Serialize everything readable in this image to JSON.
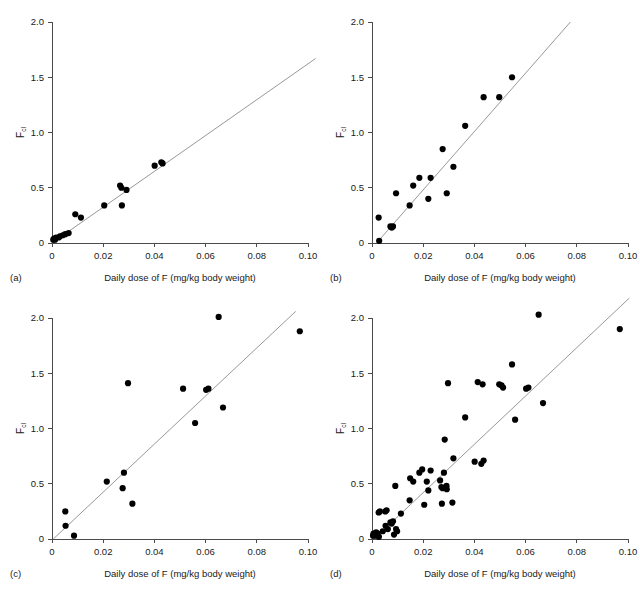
{
  "figure": {
    "width": 640,
    "height": 592,
    "background": "#ffffff",
    "point_color": "#000000",
    "line_color": "#8c8c8c",
    "axis_color": "#4a4a4a"
  },
  "chart_data": [
    {
      "type": "scatter",
      "panel": "(a)",
      "title": "",
      "xlabel": "Daily dose of F (mg/kg body weight)",
      "ylabel": "F",
      "ylabel_sub": "cl",
      "xlim": [
        0,
        0.105
      ],
      "ylim": [
        0,
        2.1
      ],
      "xticks": [
        0,
        0.02,
        0.04,
        0.06,
        0.08,
        0.1
      ],
      "xticklabels": [
        "0",
        "0.02",
        "0.04",
        "0.06",
        "0.08",
        "0.10"
      ],
      "yticks": [
        0,
        0.5,
        1.0,
        1.5,
        2.0
      ],
      "yticklabels": [
        "0",
        "0.5",
        "1.0",
        "1.5",
        "2.0"
      ],
      "grid": false,
      "legend": "none",
      "fit_line": {
        "x0": 0.0,
        "y0": 0.0,
        "x1": 0.103,
        "y1": 1.67
      },
      "points": [
        {
          "x": 0.0005,
          "y": 0.03
        },
        {
          "x": 0.0008,
          "y": 0.04
        },
        {
          "x": 0.0012,
          "y": 0.03
        },
        {
          "x": 0.0016,
          "y": 0.05
        },
        {
          "x": 0.0026,
          "y": 0.05
        },
        {
          "x": 0.0031,
          "y": 0.06
        },
        {
          "x": 0.0042,
          "y": 0.07
        },
        {
          "x": 0.0052,
          "y": 0.08
        },
        {
          "x": 0.0065,
          "y": 0.09
        },
        {
          "x": 0.0091,
          "y": 0.26
        },
        {
          "x": 0.0113,
          "y": 0.23
        },
        {
          "x": 0.0204,
          "y": 0.34
        },
        {
          "x": 0.0266,
          "y": 0.52
        },
        {
          "x": 0.0271,
          "y": 0.5
        },
        {
          "x": 0.0273,
          "y": 0.34
        },
        {
          "x": 0.0291,
          "y": 0.48
        },
        {
          "x": 0.0401,
          "y": 0.7
        },
        {
          "x": 0.0427,
          "y": 0.73
        },
        {
          "x": 0.0432,
          "y": 0.72
        }
      ]
    },
    {
      "type": "scatter",
      "panel": "(b)",
      "title": "",
      "xlabel": "Daily dose of F (mg/kg body weight)",
      "ylabel": "F",
      "ylabel_sub": "cl",
      "xlim": [
        0,
        0.105
      ],
      "ylim": [
        0,
        2.1
      ],
      "xticks": [
        0,
        0.02,
        0.04,
        0.06,
        0.08,
        0.1
      ],
      "xticklabels": [
        "0",
        "0.02",
        "0.04",
        "0.06",
        "0.08",
        "0.10"
      ],
      "yticks": [
        0,
        0.5,
        1.0,
        1.5,
        2.0
      ],
      "yticklabels": [
        "0",
        "0.5",
        "1.0",
        "1.5",
        "2.0"
      ],
      "grid": false,
      "legend": "none",
      "fit_line": {
        "x0": 0.0018,
        "y0": 0.0,
        "x1": 0.0775,
        "y1": 2.0
      },
      "points": [
        {
          "x": 0.0028,
          "y": 0.02
        },
        {
          "x": 0.0026,
          "y": 0.23
        },
        {
          "x": 0.0072,
          "y": 0.15
        },
        {
          "x": 0.0077,
          "y": 0.14
        },
        {
          "x": 0.0082,
          "y": 0.15
        },
        {
          "x": 0.0094,
          "y": 0.45
        },
        {
          "x": 0.0147,
          "y": 0.34
        },
        {
          "x": 0.0161,
          "y": 0.52
        },
        {
          "x": 0.0185,
          "y": 0.59
        },
        {
          "x": 0.022,
          "y": 0.4
        },
        {
          "x": 0.0229,
          "y": 0.59
        },
        {
          "x": 0.0276,
          "y": 0.85
        },
        {
          "x": 0.0292,
          "y": 0.45
        },
        {
          "x": 0.0318,
          "y": 0.69
        },
        {
          "x": 0.0364,
          "y": 1.06
        },
        {
          "x": 0.0436,
          "y": 1.32
        },
        {
          "x": 0.0497,
          "y": 1.32
        },
        {
          "x": 0.0547,
          "y": 1.5
        }
      ]
    },
    {
      "type": "scatter",
      "panel": "(c)",
      "title": "",
      "xlabel": "Daily dose of F (mg/kg body weight)",
      "ylabel": "F",
      "ylabel_sub": "cl",
      "xlim": [
        0,
        0.105
      ],
      "ylim": [
        0,
        2.1
      ],
      "xticks": [
        0,
        0.02,
        0.04,
        0.06,
        0.08,
        0.1
      ],
      "xticklabels": [
        "0",
        "0.02",
        "0.04",
        "0.06",
        "0.08",
        "0.10"
      ],
      "yticks": [
        0,
        0.5,
        1.0,
        1.5,
        2.0
      ],
      "yticklabels": [
        "0",
        "0.5",
        "1.0",
        "1.5",
        "2.0"
      ],
      "grid": false,
      "legend": "none",
      "fit_line": {
        "x0": 0.0005,
        "y0": 0.0,
        "x1": 0.0952,
        "y1": 2.06
      },
      "points": [
        {
          "x": 0.0052,
          "y": 0.25
        },
        {
          "x": 0.0053,
          "y": 0.12
        },
        {
          "x": 0.0086,
          "y": 0.03
        },
        {
          "x": 0.0214,
          "y": 0.52
        },
        {
          "x": 0.0281,
          "y": 0.6
        },
        {
          "x": 0.0276,
          "y": 0.46
        },
        {
          "x": 0.0297,
          "y": 1.41
        },
        {
          "x": 0.0314,
          "y": 0.32
        },
        {
          "x": 0.0512,
          "y": 1.36
        },
        {
          "x": 0.0559,
          "y": 1.05
        },
        {
          "x": 0.0602,
          "y": 1.35
        },
        {
          "x": 0.0611,
          "y": 1.36
        },
        {
          "x": 0.0651,
          "y": 2.01
        },
        {
          "x": 0.0668,
          "y": 1.19
        },
        {
          "x": 0.0968,
          "y": 1.88
        }
      ]
    },
    {
      "type": "scatter",
      "panel": "(d)",
      "title": "",
      "xlabel": "Daily dose of F (mg/kg body weight)",
      "ylabel": "F",
      "ylabel_sub": "cl",
      "xlim": [
        0,
        0.105
      ],
      "ylim": [
        0,
        2.1
      ],
      "xticks": [
        0,
        0.02,
        0.04,
        0.06,
        0.08,
        0.1
      ],
      "xticklabels": [
        "0",
        "0.02",
        "0.04",
        "0.06",
        "0.08",
        "0.10"
      ],
      "yticks": [
        0,
        0.5,
        1.0,
        1.5,
        2.0
      ],
      "yticklabels": [
        "0",
        "0.5",
        "1.0",
        "1.5",
        "2.0"
      ],
      "grid": false,
      "legend": "none",
      "fit_line": {
        "x0": 0.0008,
        "y0": 0.0,
        "x1": 0.1005,
        "y1": 2.18
      },
      "points": [
        {
          "x": 0.0004,
          "y": 0.03
        },
        {
          "x": 0.0006,
          "y": 0.05
        },
        {
          "x": 0.0009,
          "y": 0.04
        },
        {
          "x": 0.0013,
          "y": 0.03
        },
        {
          "x": 0.0016,
          "y": 0.06
        },
        {
          "x": 0.0022,
          "y": 0.05
        },
        {
          "x": 0.0027,
          "y": 0.02
        },
        {
          "x": 0.0026,
          "y": 0.24
        },
        {
          "x": 0.0031,
          "y": 0.25
        },
        {
          "x": 0.0042,
          "y": 0.07
        },
        {
          "x": 0.0052,
          "y": 0.25
        },
        {
          "x": 0.0053,
          "y": 0.12
        },
        {
          "x": 0.0057,
          "y": 0.26
        },
        {
          "x": 0.0062,
          "y": 0.09
        },
        {
          "x": 0.0072,
          "y": 0.15
        },
        {
          "x": 0.0077,
          "y": 0.14
        },
        {
          "x": 0.0082,
          "y": 0.16
        },
        {
          "x": 0.0086,
          "y": 0.04
        },
        {
          "x": 0.0091,
          "y": 0.48
        },
        {
          "x": 0.0094,
          "y": 0.09
        },
        {
          "x": 0.0098,
          "y": 0.07
        },
        {
          "x": 0.0113,
          "y": 0.23
        },
        {
          "x": 0.0147,
          "y": 0.35
        },
        {
          "x": 0.0149,
          "y": 0.55
        },
        {
          "x": 0.0161,
          "y": 0.52
        },
        {
          "x": 0.0185,
          "y": 0.6
        },
        {
          "x": 0.0196,
          "y": 0.63
        },
        {
          "x": 0.0204,
          "y": 0.31
        },
        {
          "x": 0.0214,
          "y": 0.52
        },
        {
          "x": 0.022,
          "y": 0.44
        },
        {
          "x": 0.0229,
          "y": 0.62
        },
        {
          "x": 0.0266,
          "y": 0.53
        },
        {
          "x": 0.0271,
          "y": 0.47
        },
        {
          "x": 0.0273,
          "y": 0.32
        },
        {
          "x": 0.0276,
          "y": 0.46
        },
        {
          "x": 0.0281,
          "y": 0.6
        },
        {
          "x": 0.0284,
          "y": 0.9
        },
        {
          "x": 0.0291,
          "y": 0.48
        },
        {
          "x": 0.0292,
          "y": 0.45
        },
        {
          "x": 0.0297,
          "y": 1.41
        },
        {
          "x": 0.0314,
          "y": 0.33
        },
        {
          "x": 0.0318,
          "y": 0.73
        },
        {
          "x": 0.0364,
          "y": 1.1
        },
        {
          "x": 0.0401,
          "y": 0.7
        },
        {
          "x": 0.0413,
          "y": 1.42
        },
        {
          "x": 0.0427,
          "y": 0.68
        },
        {
          "x": 0.0432,
          "y": 1.4
        },
        {
          "x": 0.0436,
          "y": 0.71
        },
        {
          "x": 0.0497,
          "y": 1.4
        },
        {
          "x": 0.0506,
          "y": 1.39
        },
        {
          "x": 0.0512,
          "y": 1.37
        },
        {
          "x": 0.0547,
          "y": 1.58
        },
        {
          "x": 0.0559,
          "y": 1.08
        },
        {
          "x": 0.0602,
          "y": 1.36
        },
        {
          "x": 0.0611,
          "y": 1.37
        },
        {
          "x": 0.0651,
          "y": 2.03
        },
        {
          "x": 0.0668,
          "y": 1.23
        },
        {
          "x": 0.0968,
          "y": 1.9
        }
      ]
    }
  ]
}
